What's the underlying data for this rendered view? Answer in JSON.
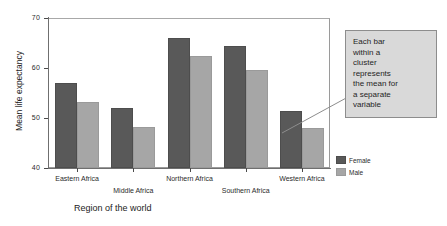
{
  "chart_data": {
    "type": "bar",
    "title": "",
    "subtitle": "",
    "xlabel": "Region of the world",
    "ylabel": "Mean life expectancy",
    "ylim": [
      40,
      70
    ],
    "yticks": [
      40,
      50,
      60,
      70
    ],
    "ytick_labels": [
      "40",
      "50",
      "60",
      "70"
    ],
    "grid": false,
    "legend_position": "right",
    "categories": [
      "Eastern Africa",
      "Middle Africa",
      "Northern Africa",
      "Southern Africa",
      "Western Africa"
    ],
    "series": [
      {
        "name": "Female",
        "color": "#595959",
        "values": [
          57.0,
          52.0,
          66.0,
          64.5,
          51.5
        ]
      },
      {
        "name": "Male",
        "color": "#a6a6a6",
        "values": [
          53.3,
          48.2,
          62.5,
          59.7,
          48.0
        ]
      }
    ],
    "annotations": [
      {
        "text": "Each bar\nwithin a\ncluster\nrepresents\nthe mean for\na separate\nvariable",
        "points_to": "Western Africa male bar"
      }
    ]
  },
  "axes": {
    "y_title": "Mean life expectancy",
    "x_title": "Region of the world"
  },
  "legend": {
    "items": [
      {
        "label": "Female",
        "color": "#595959"
      },
      {
        "label": "Male",
        "color": "#a6a6a6"
      }
    ]
  },
  "callout": {
    "text": "Each bar within a cluster represents the mean for a separate variable"
  },
  "colors": {
    "female_bar": "#595959",
    "male_bar": "#a6a6a6",
    "callout_bg": "#d9d9d9",
    "frame": "#9a9a9a",
    "text": "#2b2b2b"
  }
}
